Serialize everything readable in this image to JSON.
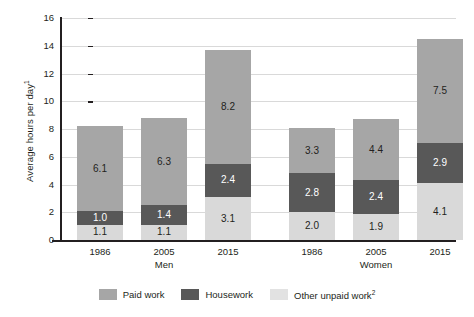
{
  "chart_data": {
    "type": "bar",
    "subtype": "stacked",
    "title": "",
    "xlabel": "",
    "ylabel": "Average hours per day",
    "ylabel_superscript": "1",
    "ylim": [
      0,
      16
    ],
    "ytick_step": 2,
    "yticks": [
      "0",
      "2",
      "4",
      "6",
      "8",
      "10",
      "12",
      "14",
      "16"
    ],
    "grid": true,
    "grid_axis": "y",
    "legend_position": "bottom",
    "categories": [
      "1986",
      "2005",
      "2015",
      "1986",
      "2005",
      "2015"
    ],
    "group_labels": [
      "Men",
      "Women"
    ],
    "series": [
      {
        "name": "Other unpaid work",
        "name_superscript": "2",
        "color": "#d9d9d9",
        "label_color": "#231f20",
        "values": [
          1.1,
          1.1,
          3.1,
          2.0,
          1.9,
          4.1
        ],
        "value_labels": [
          "1.1",
          "1.1",
          "3.1",
          "2.0",
          "1.9",
          "4.1"
        ]
      },
      {
        "name": "Housework",
        "color": "#585858",
        "label_color": "#ffffff",
        "values": [
          1.0,
          1.4,
          2.4,
          2.8,
          2.4,
          2.9
        ],
        "value_labels": [
          "1.0",
          "1.4",
          "2.4",
          "2.8",
          "2.4",
          "2.9"
        ]
      },
      {
        "name": "Paid work",
        "color": "#a6a6a6",
        "label_color": "#231f20",
        "values": [
          6.1,
          6.3,
          8.2,
          3.3,
          4.4,
          7.5
        ],
        "value_labels": [
          "6.1",
          "6.3",
          "8.2",
          "3.3",
          "4.4",
          "7.5"
        ]
      }
    ],
    "totals": [
      8.2,
      8.8,
      13.7,
      8.1,
      8.7,
      14.5
    ]
  },
  "axis": {
    "y_title": "Average hours per day",
    "y_title_sup": "1",
    "ticks": [
      "16",
      "14",
      "12",
      "10",
      "8",
      "6",
      "4",
      "2",
      "0"
    ]
  },
  "groups": [
    {
      "label": "Men",
      "bars": [
        {
          "year": "1986",
          "other_unpaid": "1.1",
          "housework": "1.0",
          "paid": "6.1"
        },
        {
          "year": "2005",
          "other_unpaid": "1.1",
          "housework": "1.4",
          "paid": "6.3"
        },
        {
          "year": "2015",
          "other_unpaid": "3.1",
          "housework": "2.4",
          "paid": "8.2"
        }
      ]
    },
    {
      "label": "Women",
      "bars": [
        {
          "year": "1986",
          "other_unpaid": "2.0",
          "housework": "2.8",
          "paid": "3.3"
        },
        {
          "year": "2005",
          "other_unpaid": "1.9",
          "housework": "2.4",
          "paid": "4.4"
        },
        {
          "year": "2015",
          "other_unpaid": "4.1",
          "housework": "2.9",
          "paid": "7.5"
        }
      ]
    }
  ],
  "legend": {
    "items": [
      {
        "label": "Paid work",
        "sup": "",
        "color": "#a6a6a6"
      },
      {
        "label": "Housework",
        "sup": "",
        "color": "#585858"
      },
      {
        "label": "Other unpaid work",
        "sup": "2",
        "color": "#e2e2e2"
      }
    ]
  },
  "colors": {
    "paid_work": "#a6a6a6",
    "housework": "#585858",
    "other_unpaid_work": "#d9d9d9",
    "axis": "#231f20",
    "gridline": "#d9d9d9",
    "background": "#ffffff"
  }
}
